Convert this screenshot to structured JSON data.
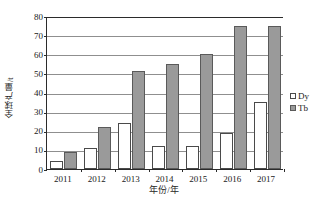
{
  "chart_data": {
    "type": "bar",
    "title": "",
    "subtitle": "",
    "xlabel": "年份/年",
    "ylabel": "全球产量/t",
    "categories": [
      "2011",
      "2012",
      "2013",
      "2014",
      "2015",
      "2016",
      "2017"
    ],
    "series": [
      {
        "name": "Dy",
        "values": [
          4,
          11,
          24,
          12,
          12,
          19,
          35
        ],
        "color": "#ffffff"
      },
      {
        "name": "Tb",
        "values": [
          9,
          22,
          51,
          55,
          60,
          75,
          75
        ],
        "color": "#9a9a9a"
      }
    ],
    "ylim": [
      0,
      80
    ],
    "ytick_values": [
      0,
      10,
      20,
      30,
      40,
      50,
      60,
      70,
      80
    ],
    "ytick_labels": [
      "0",
      "10",
      "20",
      "30",
      "40",
      "50",
      "60",
      "70",
      "80"
    ],
    "grid": true,
    "grid_axis": "y",
    "legend": [
      "Dy",
      "Tb"
    ],
    "legend_position": "right",
    "colors": {
      "dy_fill": "#ffffff",
      "tb_fill": "#9a9a9a",
      "bar_border": "#4a4a4a",
      "gridline": "#8f8f8f",
      "axis": "#2b2b2b",
      "text": "#1a1a1a",
      "background": "#ffffff"
    }
  }
}
